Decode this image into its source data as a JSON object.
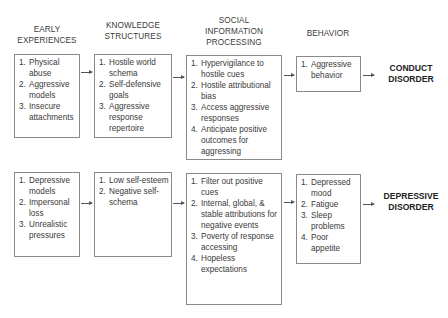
{
  "headers": {
    "early": [
      "EARLY",
      "EXPERIENCES"
    ],
    "knowledge": [
      "KNOWLEDGE",
      "STRUCTURES"
    ],
    "sip": [
      "SOCIAL",
      "INFORMATION",
      "PROCESSING"
    ],
    "behavior": [
      "BEHAVIOR"
    ]
  },
  "conduct": {
    "early": [
      {
        "n": "1.",
        "t": "Physical abuse"
      },
      {
        "n": "2.",
        "t": "Aggressive models"
      },
      {
        "n": "3.",
        "t": "Insecure attachments"
      }
    ],
    "knowledge": [
      {
        "n": "1.",
        "t": "Hostile world schema"
      },
      {
        "n": "2.",
        "t": "Self-defensive goals"
      },
      {
        "n": "3.",
        "t": "Aggressive response repertoire"
      }
    ],
    "sip": [
      {
        "n": "1.",
        "t": "Hypervigilance to hostile cues"
      },
      {
        "n": "2.",
        "t": "Hostile attributional bias"
      },
      {
        "n": "3.",
        "t": "Access aggressive responses"
      },
      {
        "n": "4.",
        "t": "Anticipate positive outcomes for aggressing"
      }
    ],
    "behavior": [
      {
        "n": "1.",
        "t": "Aggressive behavior"
      }
    ],
    "outcome": [
      "CONDUCT",
      "DISORDER"
    ]
  },
  "depressive": {
    "early": [
      {
        "n": "1.",
        "t": "Depressive models"
      },
      {
        "n": "2.",
        "t": "Impersonal loss"
      },
      {
        "n": "3.",
        "t": "Unrealistic pressures"
      }
    ],
    "knowledge": [
      {
        "n": "1.",
        "t": "Low self-esteem"
      },
      {
        "n": "2.",
        "t": "Negative self-schema"
      }
    ],
    "sip": [
      {
        "n": "1.",
        "t": "Filter out positive cues"
      },
      {
        "n": "2.",
        "t": "Internal, global, & stable attributions for negative events"
      },
      {
        "n": "3.",
        "t": "Poverty of response accessing"
      },
      {
        "n": "4.",
        "t": "Hopeless expectations"
      }
    ],
    "behavior": [
      {
        "n": "1.",
        "t": "Depressed mood"
      },
      {
        "n": "2.",
        "t": "Fatigue"
      },
      {
        "n": "3.",
        "t": "Sleep problems"
      },
      {
        "n": "4.",
        "t": "Poor appetite"
      }
    ],
    "outcome": [
      "DEPRESSIVE",
      "DISORDER"
    ]
  }
}
